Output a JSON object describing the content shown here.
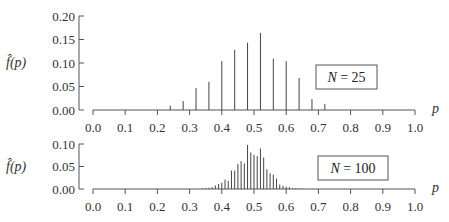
{
  "chart_data": [
    {
      "type": "bar",
      "subtype": "stem",
      "title": "",
      "legend": "N = 25",
      "xlabel": "p",
      "ylabel": "f̂(p)",
      "xlim": [
        0.0,
        1.0
      ],
      "ylim": [
        0.0,
        0.2
      ],
      "xticks": [
        "0.0",
        "0.1",
        "0.2",
        "0.3",
        "0.4",
        "0.5",
        "0.6",
        "0.7",
        "0.8",
        "0.9",
        "1.0"
      ],
      "yticks": [
        "0.00",
        "0.05",
        "0.10",
        "0.15",
        "0.20"
      ],
      "grid": false,
      "x": [
        0.24,
        0.28,
        0.32,
        0.36,
        0.4,
        0.44,
        0.48,
        0.52,
        0.56,
        0.6,
        0.64,
        0.68,
        0.72
      ],
      "values": [
        0.009,
        0.019,
        0.047,
        0.06,
        0.104,
        0.128,
        0.143,
        0.164,
        0.109,
        0.104,
        0.068,
        0.023,
        0.013
      ]
    },
    {
      "type": "bar",
      "subtype": "stem",
      "title": "",
      "legend": "N = 100",
      "xlabel": "p",
      "ylabel": "f̂(p)",
      "xlim": [
        0.0,
        1.0
      ],
      "ylim": [
        0.0,
        0.1
      ],
      "xticks": [
        "0.0",
        "0.1",
        "0.2",
        "0.3",
        "0.4",
        "0.5",
        "0.6",
        "0.7",
        "0.8",
        "0.9",
        "1.0"
      ],
      "yticks": [
        "0.00",
        "0.05",
        "0.10"
      ],
      "grid": false,
      "x": [
        0.34,
        0.35,
        0.36,
        0.37,
        0.38,
        0.39,
        0.4,
        0.41,
        0.42,
        0.43,
        0.44,
        0.45,
        0.46,
        0.47,
        0.48,
        0.49,
        0.5,
        0.51,
        0.52,
        0.53,
        0.54,
        0.55,
        0.56,
        0.57,
        0.58,
        0.59,
        0.6,
        0.61,
        0.62,
        0.63,
        0.64,
        0.65
      ],
      "values": [
        0.001,
        0.002,
        0.003,
        0.004,
        0.008,
        0.011,
        0.014,
        0.021,
        0.018,
        0.041,
        0.041,
        0.056,
        0.062,
        0.057,
        0.098,
        0.081,
        0.076,
        0.073,
        0.09,
        0.07,
        0.044,
        0.035,
        0.032,
        0.023,
        0.01,
        0.007,
        0.005,
        0.004,
        0.002,
        0.002,
        0.001,
        0.001
      ]
    }
  ]
}
